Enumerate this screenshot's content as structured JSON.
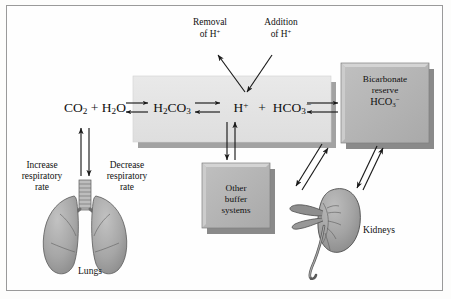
{
  "figure": {
    "background_color": "#fdfdfc",
    "border_color": "#9a9a9a"
  },
  "colors": {
    "band_fill": "#e3e3e3",
    "band_shadow": "#9d9d9d",
    "box_fill": "#b4b4b4",
    "box_shadow": "#8a8a8a",
    "box_highlight": "#d6d6d6",
    "organ_fill": "#a8a8a8",
    "organ_stroke": "#4a4a4a",
    "arrow": "#1a1a1a",
    "text": "#111111"
  },
  "reaction": {
    "name": "carbonic-acid-bicarbonate-equilibrium",
    "terms": [
      {
        "id": "co2_h2o",
        "html": "CO<sub>2</sub> + H<sub>2</sub>O",
        "x": 95,
        "y": 108
      },
      {
        "id": "h2co3",
        "html": "H<sub>2</sub>CO<sub>3</sub>",
        "x": 172,
        "y": 108
      },
      {
        "id": "h_plus",
        "html": "H<sup>+</sup>",
        "x": 241,
        "y": 108
      },
      {
        "id": "plus_sign",
        "html": "+",
        "x": 262,
        "y": 108
      },
      {
        "id": "hco3_minus",
        "html": "HCO<sub>3</sub><sup>−</sup>",
        "x": 291,
        "y": 108
      }
    ]
  },
  "band": {
    "name": "blood-plasma-band",
    "x": 133,
    "y": 76,
    "width": 198,
    "height": 66
  },
  "top_labels": [
    {
      "id": "removal",
      "name": "removal-of-h-label",
      "line1": "Removal",
      "line2": "of H",
      "sup": "+",
      "x": 210,
      "y": 17
    },
    {
      "id": "addition",
      "name": "addition-of-h-label",
      "line1": "Addition",
      "line2": "of H",
      "sup": "+",
      "x": 280,
      "y": 17
    }
  ],
  "boxes": [
    {
      "id": "bicarbonate_reserve",
      "name": "bicarbonate-reserve-box",
      "lines": [
        "Bicarbonate",
        "reserve"
      ],
      "formula_html": "HCO<sub>3</sub><sup>−</sup>",
      "x": 341,
      "y": 63,
      "width": 88,
      "height": 80
    },
    {
      "id": "other_buffer_systems",
      "name": "other-buffer-systems-box",
      "lines": [
        "Other",
        "buffer",
        "systems"
      ],
      "formula_html": "",
      "x": 202,
      "y": 163,
      "width": 68,
      "height": 65
    }
  ],
  "organs": [
    {
      "id": "lungs",
      "name": "lungs-illustration",
      "caption": "Lungs",
      "caption_x": 93,
      "caption_y": 267
    },
    {
      "id": "kidneys",
      "name": "kidneys-illustration",
      "caption": "Kidneys",
      "caption_x": 362,
      "caption_y": 228
    }
  ],
  "side_labels": [
    {
      "id": "increase_rate",
      "name": "increase-respiratory-rate-label",
      "lines": [
        "Increase",
        "respiratory",
        "rate"
      ],
      "x": 42,
      "y": 160
    },
    {
      "id": "decrease_rate",
      "name": "decrease-respiratory-rate-label",
      "lines": [
        "Decrease",
        "respiratory",
        "rate"
      ],
      "x": 127,
      "y": 160
    }
  ]
}
